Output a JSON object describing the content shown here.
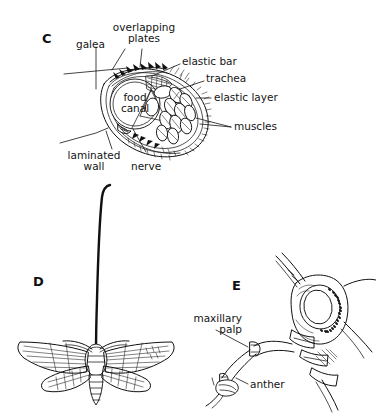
{
  "figure": {
    "background_color": "#ffffff",
    "ink_color": "#111111",
    "panels": [
      {
        "letter": "C",
        "name": "proboscis-cross-section",
        "labels": [
          {
            "key": "galea",
            "text": "galea"
          },
          {
            "key": "overlapping_plates",
            "text": "overlapping\nplates"
          },
          {
            "key": "elastic_bar",
            "text": "elastic bar"
          },
          {
            "key": "trachea",
            "text": "trachea"
          },
          {
            "key": "elastic_layer",
            "text": "elastic layer"
          },
          {
            "key": "muscles",
            "text": "muscles"
          },
          {
            "key": "food_canal",
            "text": "food\ncanal"
          },
          {
            "key": "laminated_wall",
            "text": "laminated\nwall"
          },
          {
            "key": "nerve",
            "text": "nerve"
          }
        ]
      },
      {
        "letter": "D",
        "name": "hawkmoth-with-long-proboscis",
        "labels": []
      },
      {
        "letter": "E",
        "name": "insect-head-feeding",
        "labels": [
          {
            "key": "maxillary_palp",
            "text": "maxillary\npalp"
          },
          {
            "key": "anther",
            "text": "anther"
          }
        ]
      }
    ]
  },
  "panelC": {
    "letter": "C",
    "galea": "galea",
    "overlapping_plates_line1": "overlapping",
    "overlapping_plates_line2": "plates",
    "elastic_bar": "elastic bar",
    "trachea": "trachea",
    "elastic_layer": "elastic layer",
    "muscles": "muscles",
    "food_canal_line1": "food",
    "food_canal_line2": "canal",
    "laminated_wall_line1": "laminated",
    "laminated_wall_line2": "wall",
    "nerve": "nerve"
  },
  "panelD": {
    "letter": "D"
  },
  "panelE": {
    "letter": "E",
    "maxillary_palp_line1": "maxillary",
    "maxillary_palp_line2": "palp",
    "anther": "anther"
  }
}
